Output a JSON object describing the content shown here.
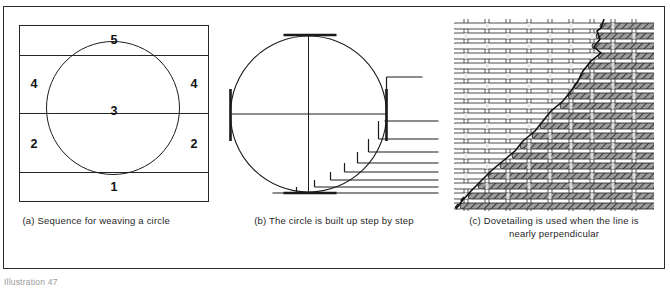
{
  "figure": {
    "label": "Illustration 47",
    "panels": [
      {
        "key": "a",
        "caption": "(a) Sequence for weaving a circle",
        "diagram": "sequence-for-weaving-a-circle",
        "bands": [
          {
            "number": "5",
            "position": "top"
          },
          {
            "number": "4",
            "position": "upper-left"
          },
          {
            "number": "4",
            "position": "upper-right"
          },
          {
            "number": "3",
            "position": "center"
          },
          {
            "number": "2",
            "position": "lower-left"
          },
          {
            "number": "2",
            "position": "lower-right"
          },
          {
            "number": "1",
            "position": "bottom"
          }
        ]
      },
      {
        "key": "b",
        "caption": "(b) The circle is built up step by step",
        "diagram": "circle-built-step-by-step",
        "elements": [
          "circle",
          "vertical-axis",
          "horizontal-axis",
          "top-tick",
          "bottom-tick",
          "left-tick",
          "right-tick",
          "staircase-steps"
        ],
        "step_count": 9
      },
      {
        "key": "c",
        "caption": "(c) Dovetailing is used when the line is nearly perpendicular",
        "diagram": "dovetailing-weave",
        "elements": [
          "light-weft",
          "dark-weft",
          "warp-threads",
          "dovetail-boundary",
          "design-line-dashed"
        ]
      }
    ]
  },
  "colors": {
    "ink": "#262626",
    "line": "#1c1c1c",
    "paper": "#ffffff",
    "weft_dark": "#6d6d6d",
    "weft_light": "#fdfdfd",
    "label_gray": "#9b9b9b"
  }
}
